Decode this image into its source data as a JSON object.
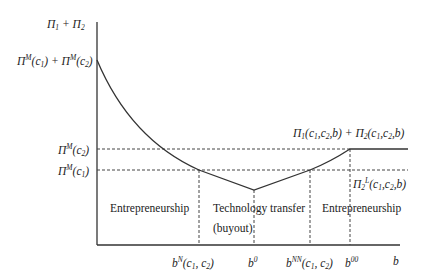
{
  "diagram": {
    "y_axis_label": {
      "main": "Π",
      "s1": "1",
      "plus": " + ",
      "main2": "Π",
      "s2": "2"
    },
    "y_ticks": {
      "top": "Π^M(c1) + Π^M(c2)",
      "mid": "Π^M(c2)",
      "low": "Π^M(c1)"
    },
    "x_axis_label": "b",
    "x_ticks": [
      {
        "id": "bN",
        "base": "b",
        "sup": "N",
        "rest": "(c",
        "s1": "1",
        "comma": ", c",
        "s2": "2",
        "close": ")"
      },
      {
        "id": "b0",
        "base": "b",
        "sup": "0"
      },
      {
        "id": "bNN",
        "base": "b",
        "sup": "NN",
        "rest": "(c",
        "s1": "1",
        "comma": ", c",
        "s2": "2",
        "close": ")"
      },
      {
        "id": "b00",
        "base": "b",
        "sup": "00"
      }
    ],
    "curve_labels": {
      "sum": "Π1(c1,c2,b) + Π2(c1,c2,b)",
      "pi2L": "Π2L(c1,c2,b)"
    },
    "regions": [
      {
        "label": "Entrepreneurship"
      },
      {
        "label": "Technology transfer",
        "line2": "(buyout)"
      },
      {
        "label": "Entrepreneurship"
      }
    ],
    "colors": {
      "line": "#333333",
      "dash": "#444444",
      "background": "#ffffff"
    }
  }
}
